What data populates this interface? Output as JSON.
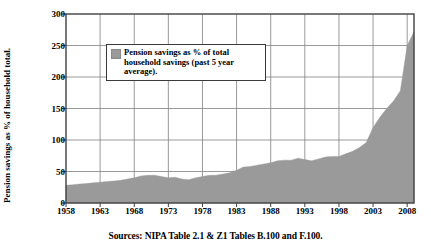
{
  "figure": {
    "ylabel": "Pension savings as % of household total.",
    "source_note": "Sources: NIPA Table 2.1 & Z1 Tables B.100 and F.100.",
    "legend_label": "Pension savings as % of total household savings (past 5 year average)."
  },
  "colors": {
    "area_fill": "#9a9a9a",
    "grid": "#808080",
    "axis": "#404040",
    "text": "#000000",
    "background": "#ffffff"
  },
  "chart_data": {
    "type": "area",
    "title": "",
    "xlabel": "",
    "ylabel": "Pension savings as % of household total.",
    "xlim": [
      1958,
      2009
    ],
    "ylim": [
      0,
      300
    ],
    "ytick_step": 50,
    "xtick_step": 5,
    "grid": true,
    "legend_position": "inside-upper-left",
    "xticks": [
      1958,
      1963,
      1968,
      1973,
      1978,
      1983,
      1988,
      1993,
      1998,
      2003,
      2008
    ],
    "yticks": [
      0,
      50,
      100,
      150,
      200,
      250,
      300
    ],
    "series": [
      {
        "name": "Pension savings as % of total household savings (past 5 year average).",
        "x": [
          1958,
          1959,
          1960,
          1961,
          1962,
          1963,
          1964,
          1965,
          1966,
          1967,
          1968,
          1969,
          1970,
          1971,
          1972,
          1973,
          1974,
          1975,
          1976,
          1977,
          1978,
          1979,
          1980,
          1981,
          1982,
          1983,
          1984,
          1985,
          1986,
          1987,
          1988,
          1989,
          1990,
          1991,
          1992,
          1993,
          1994,
          1995,
          1996,
          1997,
          1998,
          1999,
          2000,
          2001,
          2002,
          2003,
          2004,
          2005,
          2006,
          2007,
          2008,
          2009
        ],
        "values": [
          28,
          29,
          30,
          31,
          32,
          33,
          34,
          35,
          36,
          38,
          40,
          43,
          44,
          44,
          42,
          40,
          41,
          38,
          37,
          40,
          42,
          44,
          44,
          46,
          48,
          52,
          57,
          58,
          60,
          62,
          64,
          67,
          68,
          68,
          71,
          69,
          67,
          70,
          73,
          74,
          74,
          78,
          82,
          88,
          96,
          120,
          136,
          150,
          162,
          178,
          250,
          272
        ]
      }
    ],
    "peak": {
      "value": 275,
      "year": 2008
    },
    "minimum": {
      "value": 28,
      "year": 1958
    }
  }
}
